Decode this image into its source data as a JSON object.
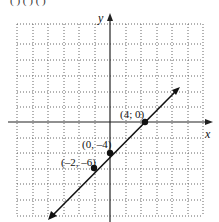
{
  "header": {
    "partial_text": "(        )   (        )   (               )"
  },
  "graph": {
    "x_axis_label": "x",
    "y_axis_label": "y",
    "points": [
      {
        "label": "(4; 0)",
        "x": 4,
        "y": 0
      },
      {
        "label": "(0, –4)",
        "x": 0,
        "y": -4
      },
      {
        "label": "(–2, –6)",
        "x": -2,
        "y": -6
      }
    ],
    "line": {
      "slope": 1,
      "intercept": -4
    },
    "colors": {
      "line": "#111111",
      "grid": "#555555",
      "axis": "#222222"
    }
  }
}
